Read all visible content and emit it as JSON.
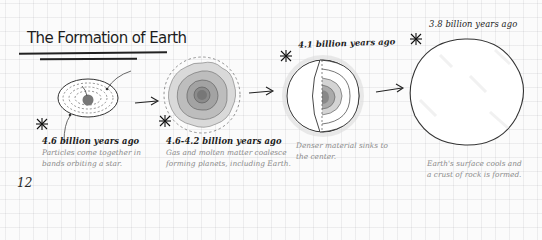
{
  "page": {
    "title": "The Formation of Earth",
    "page_number": "12"
  },
  "stages": [
    {
      "era": "4.6 billion years ago",
      "description_line1": "Particles come together in",
      "description_line2": "bands orbiting a star.",
      "icon": "dust-disk-illustration"
    },
    {
      "era": "4.6-4.2 billion years ago",
      "description_line1": "Gas and molten matter coalesce",
      "description_line2": "forming planets, including Earth.",
      "icon": "protoplanet-illustration"
    },
    {
      "era": "4.1 billion years ago",
      "description_line1": "Denser material sinks to",
      "description_line2": "the center.",
      "icon": "layered-earth-cutaway-illustration"
    },
    {
      "era": "3.8 billion years ago",
      "description_line1": "Earth's surface cools and",
      "description_line2": "a crust of rock is formed.",
      "icon": "cooled-earth-illustration"
    }
  ],
  "colors": {
    "ink": "#222222",
    "description_gray": "#8a8a8a",
    "grid": "#e3e3e6",
    "paper": "#fbfbfb"
  }
}
